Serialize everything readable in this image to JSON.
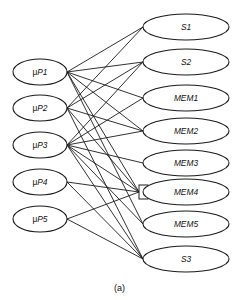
{
  "figure": {
    "caption": "(a)",
    "type": "bipartite-graph",
    "stroke_color": "#1a1a1a",
    "background_color": "#ffffff"
  },
  "left_nodes": [
    {
      "id": "uP1",
      "prefix": "μ",
      "label": "P1",
      "full_label": "μP1",
      "cx": 40,
      "cy": 72,
      "rx": 27,
      "ry": 13
    },
    {
      "id": "uP2",
      "prefix": "μ",
      "label": "P2",
      "full_label": "μP2",
      "cx": 40,
      "cy": 108,
      "rx": 27,
      "ry": 13
    },
    {
      "id": "uP3",
      "prefix": "μ",
      "label": "P3",
      "full_label": "μP3",
      "cx": 40,
      "cy": 145,
      "rx": 27,
      "ry": 13
    },
    {
      "id": "uP4",
      "prefix": "μ",
      "label": "P4",
      "full_label": "μP4",
      "cx": 40,
      "cy": 182,
      "rx": 27,
      "ry": 13
    },
    {
      "id": "uP5",
      "prefix": "μ",
      "label": "P5",
      "full_label": "μP5",
      "cx": 40,
      "cy": 219,
      "rx": 27,
      "ry": 13
    }
  ],
  "right_nodes": [
    {
      "id": "S1",
      "label": "S1",
      "cx": 186,
      "cy": 27,
      "rx": 43,
      "ry": 13,
      "has_connector_box": false
    },
    {
      "id": "S2",
      "label": "S2",
      "cx": 186,
      "cy": 62,
      "rx": 43,
      "ry": 13,
      "has_connector_box": false
    },
    {
      "id": "MEM1",
      "label": "MEM1",
      "cx": 186,
      "cy": 98,
      "rx": 43,
      "ry": 13,
      "has_connector_box": false
    },
    {
      "id": "MEM2",
      "label": "MEM2",
      "cx": 186,
      "cy": 131,
      "rx": 43,
      "ry": 13,
      "has_connector_box": false
    },
    {
      "id": "MEM3",
      "label": "MEM3",
      "cx": 186,
      "cy": 163,
      "rx": 43,
      "ry": 13,
      "has_connector_box": false
    },
    {
      "id": "MEM4",
      "label": "MEM4",
      "cx": 186,
      "cy": 192,
      "rx": 43,
      "ry": 13,
      "has_connector_box": true
    },
    {
      "id": "MEM5",
      "label": "MEM5",
      "cx": 186,
      "cy": 224,
      "rx": 43,
      "ry": 13,
      "has_connector_box": false
    },
    {
      "id": "S3",
      "label": "S3",
      "cx": 186,
      "cy": 259,
      "rx": 43,
      "ry": 13,
      "has_connector_box": false
    }
  ],
  "edges": [
    {
      "from": "uP1",
      "to": "S1"
    },
    {
      "from": "uP1",
      "to": "S2"
    },
    {
      "from": "uP1",
      "to": "MEM1"
    },
    {
      "from": "uP1",
      "to": "MEM2"
    },
    {
      "from": "uP1",
      "to": "MEM4"
    },
    {
      "from": "uP1",
      "to": "MEM5"
    },
    {
      "from": "uP2",
      "to": "S1"
    },
    {
      "from": "uP2",
      "to": "S2"
    },
    {
      "from": "uP2",
      "to": "MEM2"
    },
    {
      "from": "uP2",
      "to": "MEM4"
    },
    {
      "from": "uP2",
      "to": "S3"
    },
    {
      "from": "uP3",
      "to": "S2"
    },
    {
      "from": "uP3",
      "to": "MEM1"
    },
    {
      "from": "uP3",
      "to": "MEM2"
    },
    {
      "from": "uP3",
      "to": "MEM3"
    },
    {
      "from": "uP3",
      "to": "MEM4"
    },
    {
      "from": "uP3",
      "to": "MEM5"
    },
    {
      "from": "uP3",
      "to": "S3"
    },
    {
      "from": "uP4",
      "to": "MEM4"
    },
    {
      "from": "uP4",
      "to": "S3"
    },
    {
      "from": "uP5",
      "to": "MEM4"
    },
    {
      "from": "uP5",
      "to": "S3"
    }
  ],
  "connector_box": {
    "node": "MEM4",
    "x": 139,
    "y": 185,
    "width": 9,
    "height": 14
  }
}
